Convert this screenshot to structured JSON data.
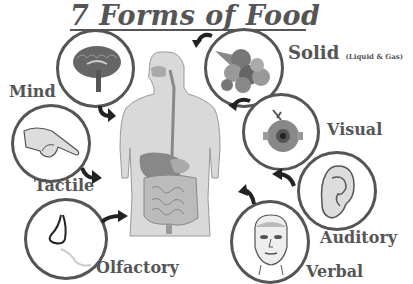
{
  "title": "7 Forms of Food",
  "forms": [
    {
      "id": "mind",
      "label": "Mind",
      "icon": "brain-icon"
    },
    {
      "id": "solid",
      "label": "Solid",
      "sublabel": "(Liquid & Gas)",
      "icon": "food-cornucopia-icon"
    },
    {
      "id": "tactile",
      "label": "Tactile",
      "icon": "hand-icon"
    },
    {
      "id": "visual",
      "label": "Visual",
      "icon": "eyeball-icon"
    },
    {
      "id": "auditory",
      "label": "Auditory",
      "icon": "ear-icon"
    },
    {
      "id": "olfactory",
      "label": "Olfactory",
      "icon": "nose-icon"
    },
    {
      "id": "verbal",
      "label": "Verbal",
      "icon": "face-icon"
    }
  ],
  "center": {
    "icon": "human-digestive-system-icon"
  },
  "colors": {
    "text": "#555555",
    "ring": "#555555",
    "arrow": "#222222",
    "body": "#d9d9d9"
  }
}
